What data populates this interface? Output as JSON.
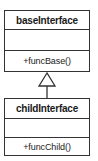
{
  "diagram": {
    "type": "uml-class-inheritance",
    "classes": [
      {
        "name": "baseInterface",
        "attributes": [],
        "operations": [
          "+funcBase()"
        ]
      },
      {
        "name": "childInterface",
        "attributes": [],
        "operations": [
          "+funcChild()"
        ]
      }
    ],
    "relationships": [
      {
        "kind": "generalization",
        "from": "childInterface",
        "to": "baseInterface",
        "arrowhead": "hollow-triangle"
      }
    ],
    "colors": {
      "line": "#333333",
      "background": "#ffffff",
      "text": "#1a1a1a"
    }
  }
}
